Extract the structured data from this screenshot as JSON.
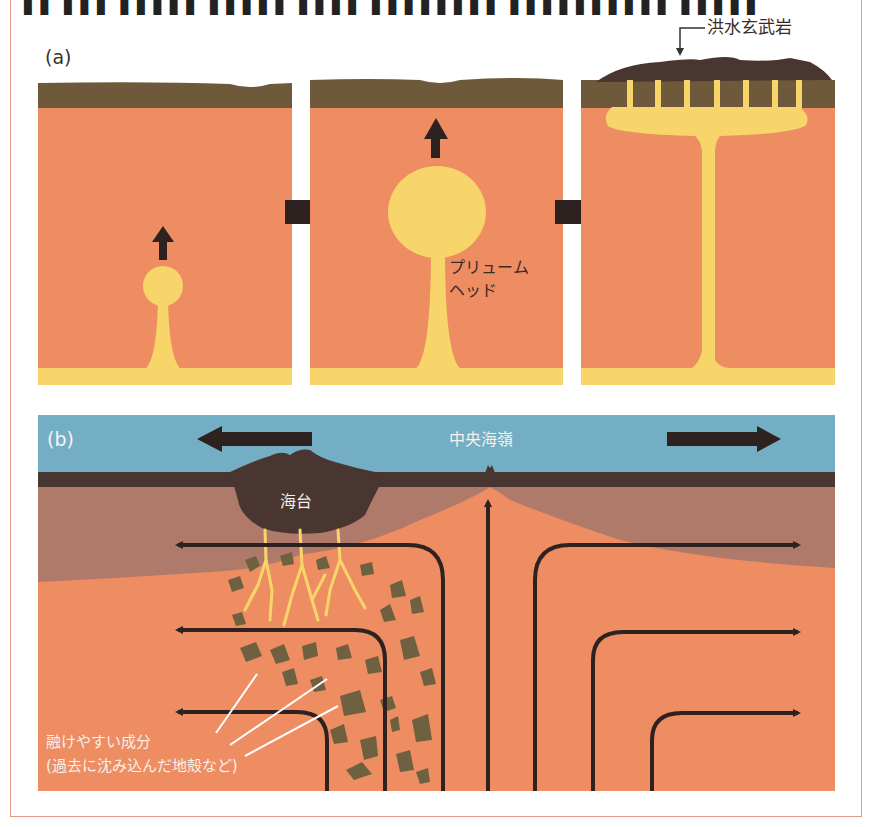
{
  "header": {
    "clipped_caption": "▌▌ ▌▌▌ ▌▌▌▌▌ ▌▌▌▌▌ ▌▌▌▌ ▌▌▌▌▌▌▌▌ ▌▌▌▌▌▌▌▌▌▌ ▌▌▌▌▌"
  },
  "panel_a": {
    "label": "(a)",
    "stages": [
      {
        "name": "stage-1-small-plume",
        "head_radius": 16
      },
      {
        "name": "stage-2-large-plume-head",
        "head_radius": 43
      },
      {
        "name": "stage-3-flood-basalt-eruption"
      }
    ],
    "plume_head_label_line1": "プリュームー",
    "plume_head_label_line1_exact": "プリューム",
    "plume_head_label_line2": "ヘッド",
    "flood_basalt_label": "洪水玄武岩"
  },
  "panel_b": {
    "label": "(b)",
    "mid_ocean_ridge_label": "中央海嶺",
    "oceanic_plateau_label": "海台",
    "fusible_component_line1": "融けやすい成分",
    "fusible_component_line2": "(過去に沈み込んだ地殻など)"
  },
  "colors": {
    "mantle": "#ee8c62",
    "plume": "#f7d56a",
    "crust_a": "#6e5a3a",
    "crust_dark": "#4a3630",
    "ocean": "#74aec4",
    "lithosphere": "#b07a6a",
    "arrow": "#2e2220",
    "rock": "#6f6140",
    "frame": "#e8958a"
  }
}
